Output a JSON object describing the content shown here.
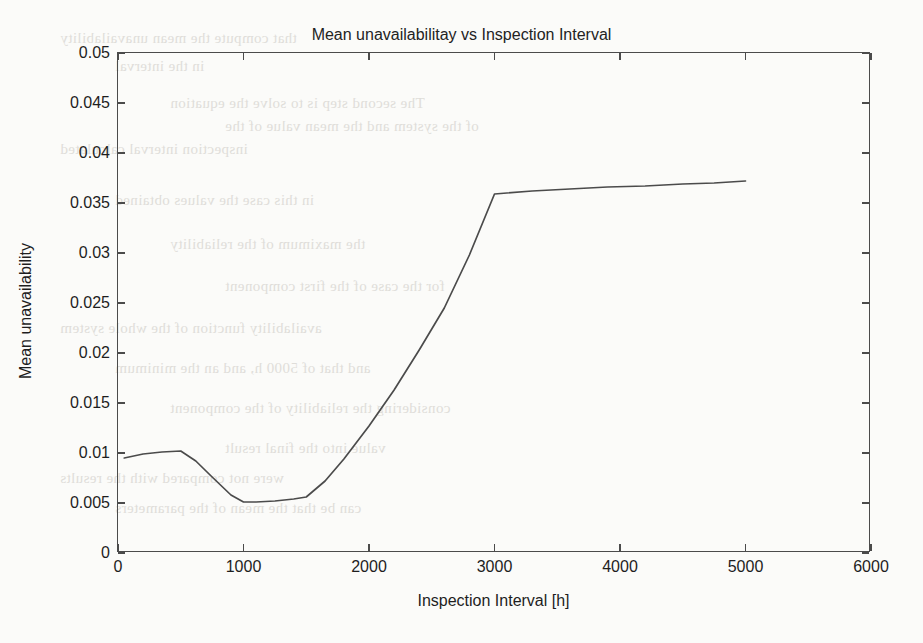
{
  "chart_data": {
    "type": "line",
    "title": "Mean unavailabilitay vs Inspection Interval",
    "xlabel": "Inspection Interval [h]",
    "ylabel": "Mean unavailability",
    "xlim": [
      0,
      6000
    ],
    "ylim": [
      0,
      0.05
    ],
    "grid": false,
    "legend": null,
    "xticks": [
      "0",
      "1000",
      "2000",
      "3000",
      "4000",
      "5000",
      "6000"
    ],
    "xtick_values": [
      0,
      1000,
      2000,
      3000,
      4000,
      5000,
      6000
    ],
    "yticks": [
      "0",
      "0.005",
      "0.01",
      "0.015",
      "0.02",
      "0.025",
      "0.03",
      "0.035",
      "0.04",
      "0.045",
      "0.05"
    ],
    "ytick_values": [
      0,
      0.005,
      0.01,
      0.015,
      0.02,
      0.025,
      0.03,
      0.035,
      0.04,
      0.045,
      0.05
    ],
    "line_color": "#4b4b4b",
    "series": [
      {
        "name": "Mean unavailability",
        "x": [
          50,
          200,
          350,
          500,
          620,
          750,
          900,
          1000,
          1100,
          1250,
          1400,
          1500,
          1650,
          1800,
          2000,
          2200,
          2400,
          2600,
          2800,
          3000,
          3300,
          3600,
          3900,
          4200,
          4500,
          4750,
          5000
        ],
        "y": [
          0.0095,
          0.0099,
          0.0101,
          0.0102,
          0.0092,
          0.0076,
          0.0058,
          0.0051,
          0.0051,
          0.0052,
          0.0054,
          0.0056,
          0.0072,
          0.0094,
          0.0127,
          0.0163,
          0.0203,
          0.0245,
          0.0298,
          0.0359,
          0.0362,
          0.0364,
          0.0366,
          0.0367,
          0.0369,
          0.037,
          0.0372
        ]
      }
    ]
  },
  "scan_bleed": {
    "lines": [
      "that compute the mean unavailability",
      "in the interval",
      "The second step is to solve the equation",
      "of the system and the mean value of the",
      "inspection interval calculated",
      "in this case the values obtained",
      "the maximum of the reliability",
      "for the case of the first component",
      "availability function of the whole system",
      "and that of 5000 h, and an the minimum",
      "considering the reliability of the component",
      "value into the final result",
      "were not compared with the results",
      "can be that the mean of the parameters"
    ]
  }
}
